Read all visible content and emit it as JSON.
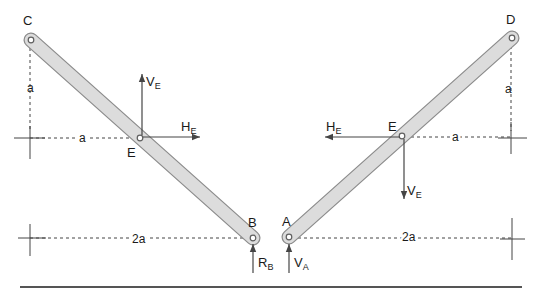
{
  "figure": {
    "width": 542,
    "height": 298
  },
  "colors": {
    "background": "#ffffff",
    "bar_fill": "#dcdcdc",
    "bar_outline": "#8c8c8c",
    "line": "#454545",
    "ground": "#555555",
    "pin_fill": "#ffffff",
    "pin_stroke": "#5f5f5f",
    "text": "#1a1a1a"
  },
  "diagram": {
    "bars": [
      {
        "name": "bar-CB",
        "x1": 31,
        "y1": 40,
        "x2": 253,
        "y2": 238,
        "outer_width": 15,
        "inner_width": 12.5
      },
      {
        "name": "bar-AD",
        "x1": 289,
        "y1": 237,
        "x2": 512,
        "y2": 38,
        "outer_width": 15,
        "inner_width": 12.5
      }
    ],
    "pins": [
      {
        "name": "pin-C",
        "x": 31,
        "y": 40
      },
      {
        "name": "pin-E-left",
        "x": 140,
        "y": 138
      },
      {
        "name": "pin-B",
        "x": 253,
        "y": 238
      },
      {
        "name": "pin-A",
        "x": 289,
        "y": 237
      },
      {
        "name": "pin-E-right",
        "x": 402,
        "y": 136
      },
      {
        "name": "pin-D",
        "x": 512,
        "y": 38
      }
    ],
    "dashed_lines": [
      {
        "name": "dim-line-C-vertical",
        "x1": 30,
        "y1": 48,
        "x2": 30,
        "y2": 132
      },
      {
        "name": "dim-line-a-left",
        "x1": 30,
        "y1": 138,
        "x2": 137,
        "y2": 138
      },
      {
        "name": "dim-line-2a-left",
        "x1": 30,
        "y1": 238,
        "x2": 250,
        "y2": 238
      },
      {
        "name": "dim-line-D-vertical",
        "x1": 511,
        "y1": 46,
        "x2": 511,
        "y2": 131
      },
      {
        "name": "dim-line-a-right",
        "x1": 405,
        "y1": 137,
        "x2": 510,
        "y2": 137
      },
      {
        "name": "dim-line-2a-right",
        "x1": 292,
        "y1": 238,
        "x2": 511,
        "y2": 238
      }
    ],
    "solid_lines": [
      {
        "name": "axis-cross-left-upper-h",
        "x1": 14,
        "y1": 138,
        "x2": 45,
        "y2": 138,
        "w": 1
      },
      {
        "name": "axis-cross-left-upper-v",
        "x1": 30,
        "y1": 126,
        "x2": 30,
        "y2": 159,
        "w": 1
      },
      {
        "name": "axis-cross-left-lower-h",
        "x1": 18,
        "y1": 238,
        "x2": 46,
        "y2": 238,
        "w": 1
      },
      {
        "name": "axis-cross-left-lower-v",
        "x1": 30,
        "y1": 224,
        "x2": 30,
        "y2": 256,
        "w": 1
      },
      {
        "name": "axis-cross-right-upper-h",
        "x1": 498,
        "y1": 138,
        "x2": 527,
        "y2": 138,
        "w": 1
      },
      {
        "name": "axis-cross-right-upper-v",
        "x1": 511,
        "y1": 122,
        "x2": 511,
        "y2": 154,
        "w": 1
      },
      {
        "name": "axis-cross-right-lower-h",
        "x1": 500,
        "y1": 239,
        "x2": 525,
        "y2": 239,
        "w": 1
      },
      {
        "name": "axis-cross-right-lower-v",
        "x1": 512,
        "y1": 218,
        "x2": 512,
        "y2": 260,
        "w": 1
      },
      {
        "name": "ground-line",
        "x1": 20,
        "y1": 287,
        "x2": 522,
        "y2": 287,
        "w": 2
      }
    ],
    "arrows": [
      {
        "name": "force-VE-left-arrow",
        "x1": 142,
        "y1": 135,
        "x2": 142,
        "y2": 74
      },
      {
        "name": "force-HE-left-arrow",
        "x1": 143,
        "y1": 137,
        "x2": 200,
        "y2": 137
      },
      {
        "name": "force-HE-right-arrow",
        "x1": 400,
        "y1": 137,
        "x2": 325,
        "y2": 137
      },
      {
        "name": "force-VE-right-arrow",
        "x1": 404,
        "y1": 139,
        "x2": 404,
        "y2": 199
      },
      {
        "name": "reaction-RB-arrow",
        "x1": 253,
        "y1": 273,
        "x2": 253,
        "y2": 244
      },
      {
        "name": "reaction-VA-arrow",
        "x1": 289,
        "y1": 273,
        "x2": 289,
        "y2": 244
      }
    ],
    "labels": [
      {
        "name": "label-C",
        "text": "C",
        "x": 23,
        "y": 25,
        "size": 13
      },
      {
        "name": "label-D",
        "text": "D",
        "x": 506,
        "y": 24,
        "size": 13
      },
      {
        "name": "label-B",
        "text": "B",
        "x": 248,
        "y": 227,
        "size": 13
      },
      {
        "name": "label-A",
        "text": "A",
        "x": 282,
        "y": 226,
        "size": 13
      },
      {
        "name": "label-E-left",
        "text": "E",
        "x": 127,
        "y": 157,
        "size": 13
      },
      {
        "name": "label-E-right",
        "text": "E",
        "x": 388,
        "y": 131,
        "size": 13
      },
      {
        "name": "label-a-left-vertical",
        "text": "a",
        "x": 27,
        "y": 92,
        "size": 12
      },
      {
        "name": "label-a-left-horizontal",
        "text": "a",
        "x": 79,
        "y": 142,
        "size": 12,
        "halo": true
      },
      {
        "name": "label-a-right-vertical",
        "text": "a",
        "x": 505,
        "y": 93,
        "size": 12
      },
      {
        "name": "label-a-right-horizontal",
        "text": "a",
        "x": 452,
        "y": 141,
        "size": 12,
        "halo": true
      },
      {
        "name": "label-2a-left",
        "text": "2a",
        "x": 132,
        "y": 243,
        "size": 12,
        "halo": true
      },
      {
        "name": "label-2a-right",
        "text": "2a",
        "x": 402,
        "y": 241,
        "size": 12,
        "halo": true
      },
      {
        "name": "label-VE-left",
        "text": "V",
        "sub": "E",
        "x": 146,
        "y": 86,
        "size": 13
      },
      {
        "name": "label-HE-left",
        "text": "H",
        "sub": "E",
        "x": 181,
        "y": 131,
        "size": 13
      },
      {
        "name": "label-HE-right",
        "text": "H",
        "sub": "E",
        "x": 326,
        "y": 131,
        "size": 13
      },
      {
        "name": "label-VE-right",
        "text": "V",
        "sub": "E",
        "x": 407,
        "y": 195,
        "size": 13
      },
      {
        "name": "label-RB",
        "text": "R",
        "sub": "B",
        "x": 258,
        "y": 267,
        "size": 13
      },
      {
        "name": "label-VA",
        "text": "V",
        "sub": "A",
        "x": 294,
        "y": 267,
        "size": 13
      }
    ]
  }
}
